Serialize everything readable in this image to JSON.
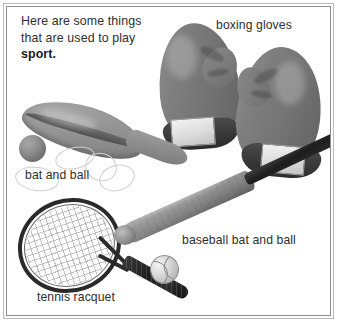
{
  "page": {
    "background_color": "#ffffff",
    "frame_color_outer": "#b9b9c2",
    "frame_color_inner": "#8d8d95",
    "text_color": "#2e2e2e"
  },
  "intro": {
    "line1": "Here are some things",
    "line2": "that are used to play",
    "emphasis": "sport."
  },
  "labels": {
    "boxing_gloves": "boxing gloves",
    "bat_and_ball": "bat and ball",
    "baseball_bat_and_ball": "baseball bat and ball",
    "tennis_racquet": "tennis racquet"
  },
  "objects": [
    {
      "name": "boxing-glove-left",
      "label": "boxing gloves",
      "color": "#757575"
    },
    {
      "name": "boxing-glove-right",
      "label": "boxing gloves",
      "color": "#757575"
    },
    {
      "name": "paddle-bat",
      "label": "bat and ball",
      "color": "#9b9b9b"
    },
    {
      "name": "small-ball",
      "label": "bat and ball",
      "color": "#8d8d8d"
    },
    {
      "name": "tennis-racquet",
      "label": "tennis racquet",
      "color": "#2a2a2a"
    },
    {
      "name": "baseball-bat",
      "label": "baseball bat and ball",
      "color": "#878787"
    },
    {
      "name": "baseball",
      "label": "baseball bat and ball",
      "color": "#dddddd"
    }
  ]
}
